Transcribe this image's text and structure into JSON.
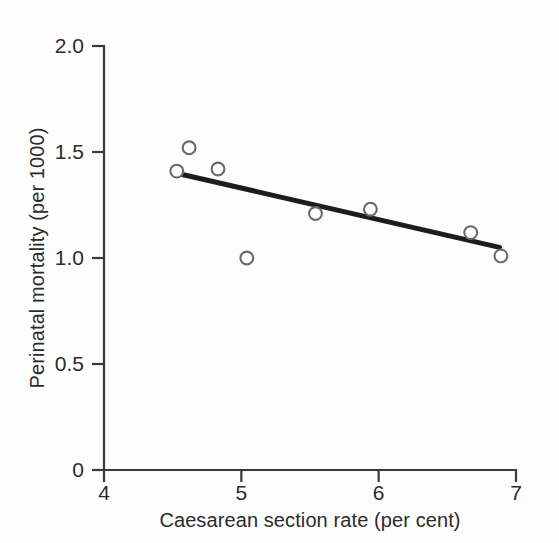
{
  "figure": {
    "background_color": "#fdfdfd",
    "ink_color": "#2b2b2b",
    "marker_stroke_color": "#6a6a6a",
    "marker_fill_color": "#ffffff",
    "fit_line_color": "#1d1d1d"
  },
  "chart_data": {
    "type": "scatter",
    "title": "",
    "subtitle": "",
    "xlabel": "Caesarean section rate (per cent)",
    "ylabel": "Perinatal mortality (per 1000)",
    "xlim": [
      4,
      7
    ],
    "ylim": [
      0,
      2.0
    ],
    "xticks": [
      4,
      5,
      6,
      7
    ],
    "xticklabels": [
      "4",
      "5",
      "6",
      "7"
    ],
    "yticks": [
      0,
      0.5,
      1.0,
      1.5,
      2.0
    ],
    "yticklabels": [
      "0",
      "0.5",
      "1.0",
      "1.5",
      "2.0"
    ],
    "grid": false,
    "legend": null,
    "legend_position": "none",
    "tick_direction": "out",
    "spines": [
      "left",
      "bottom"
    ],
    "marker_style": "open-circle",
    "points": [
      {
        "x": 4.53,
        "y": 1.41
      },
      {
        "x": 4.62,
        "y": 1.52
      },
      {
        "x": 4.83,
        "y": 1.42
      },
      {
        "x": 5.04,
        "y": 1.0
      },
      {
        "x": 5.54,
        "y": 1.21
      },
      {
        "x": 5.94,
        "y": 1.23
      },
      {
        "x": 6.67,
        "y": 1.12
      },
      {
        "x": 6.89,
        "y": 1.01
      }
    ],
    "series": [
      {
        "name": "Hospitals",
        "x": [
          4.53,
          4.62,
          4.83,
          5.04,
          5.54,
          5.94,
          6.67,
          6.89
        ],
        "values": [
          1.41,
          1.52,
          1.42,
          1.0,
          1.21,
          1.23,
          1.12,
          1.01
        ]
      }
    ],
    "fit_line": {
      "name": "regression line",
      "x": [
        4.53,
        6.88
      ],
      "y": [
        1.4,
        1.05
      ]
    },
    "annotations": []
  }
}
